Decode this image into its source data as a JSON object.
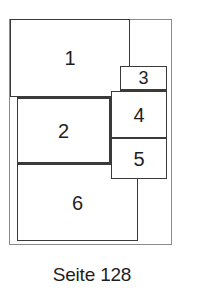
{
  "diagram": {
    "type": "page-layout",
    "frame": {
      "left": 9,
      "top": 19,
      "right": 172,
      "bottom": 245
    },
    "boxes": [
      {
        "label": "1",
        "left": 10,
        "top": 19,
        "right": 130,
        "bottom": 97
      },
      {
        "label": "2",
        "left": 17,
        "top": 97,
        "right": 111,
        "bottom": 164
      },
      {
        "label": "3",
        "left": 120,
        "top": 66,
        "right": 167,
        "bottom": 91
      },
      {
        "label": "4",
        "left": 111,
        "top": 91,
        "right": 167,
        "bottom": 139
      },
      {
        "label": "5",
        "left": 111,
        "top": 138,
        "right": 167,
        "bottom": 179
      },
      {
        "label": "6",
        "left": 17,
        "top": 163,
        "right": 138,
        "bottom": 241
      }
    ]
  },
  "caption": "Seite 128"
}
